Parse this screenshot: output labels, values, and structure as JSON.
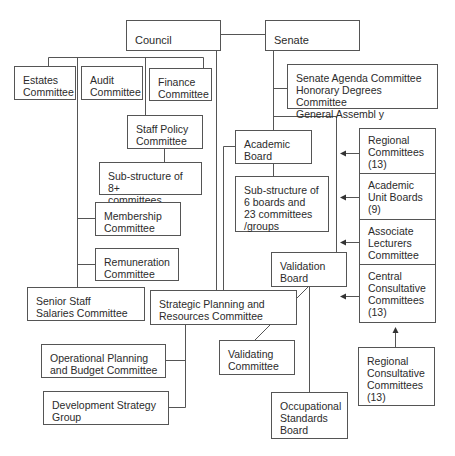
{
  "title_fragment": "",
  "nodes": {
    "council": "Council",
    "senate": "Senate",
    "estates": "Estates\nCommittee",
    "audit": "Audit\nCommittee",
    "finance": "Finance\nCommittee",
    "staff_policy": "Staff Policy\nCommittee",
    "staff_substructure": "Sub-structure of 8+\ncommittees",
    "membership": "Membership\nCommittee",
    "remuneration": "Remuneration\nCommittee",
    "senior_staff": "Senior Staff\nSalaries Committee",
    "strategic_planning": "Strategic Planning and\nResources Committee",
    "operational_planning": "Operational Planning\nand Budget Committee",
    "development_strategy": "Development Strategy\nGroup",
    "senate_committees": "Senate Agenda Committee\nHonorary Degrees Committee\nGeneral Assembl y",
    "academic_board": "Academic\nBoard",
    "academic_substructure": "Sub-structure of\n6 boards and\n23 committees\n/groups",
    "validation_board": "Validation\nBoard",
    "validating_committee": "Validating\nCommittee",
    "occupational_standards": "Occupational\nStandards\nBoard",
    "regional_committees": "Regional\nCommittees\n(13)",
    "academic_unit_boards": "Academic\nUnit Boards\n(9)",
    "associate_lecturers": "Associate\nLecturers\nCommittee",
    "central_consultative": "Central\nConsultative\nCommittees\n(13)",
    "regional_consultative": "Regional\nConsultative\nCommittees\n(13)"
  },
  "colors": {
    "line": "#555555",
    "text": "#2b2b2b",
    "background": "#ffffff"
  }
}
